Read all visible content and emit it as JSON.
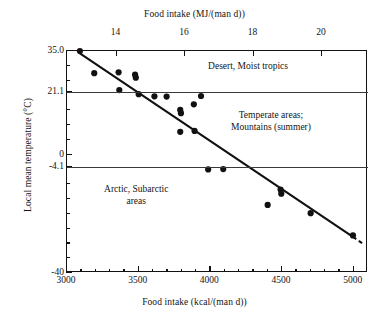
{
  "chart_data": {
    "type": "scatter",
    "title": "",
    "xlabel": "Food intake (kcal/(man d))",
    "xlabel_top": "Food intake (MJ/(man d))",
    "ylabel": "Local mean temperature (°C)",
    "xlim": [
      3000,
      5100
    ],
    "ylim": [
      -40,
      35
    ],
    "xlim_top": [
      12.552,
      21.34
    ],
    "grid": false,
    "legend": "none",
    "xticks": [
      3000,
      3500,
      4000,
      4500,
      5000
    ],
    "xticklabels": [
      "3000",
      "3500",
      "4000",
      "4500",
      "5000"
    ],
    "xticks_minor": [
      3100,
      3200,
      3300,
      3400,
      3600,
      3700,
      3800,
      3900,
      4100,
      4200,
      4300,
      4400,
      4600,
      4700,
      4800,
      4900
    ],
    "xticks_top": [
      14,
      16,
      18,
      20
    ],
    "xticklabels_top": [
      "14",
      "16",
      "18",
      "20"
    ],
    "yticks": [
      35.0,
      21.1,
      0,
      -4.1,
      -40
    ],
    "yticklabels": [
      "35.0",
      "21.1",
      "0",
      "-4.1",
      "-40"
    ],
    "yticks_minor": [
      30,
      25,
      15,
      10,
      5,
      -10,
      -15,
      -20,
      -25,
      -30,
      -35
    ],
    "points": [
      {
        "x": 3090,
        "y": 35.0
      },
      {
        "x": 3190,
        "y": 27.5
      },
      {
        "x": 3360,
        "y": 27.8
      },
      {
        "x": 3365,
        "y": 21.8
      },
      {
        "x": 3475,
        "y": 27.0
      },
      {
        "x": 3480,
        "y": 26.0
      },
      {
        "x": 3500,
        "y": 20.4
      },
      {
        "x": 3610,
        "y": 19.7
      },
      {
        "x": 3695,
        "y": 19.6
      },
      {
        "x": 3790,
        "y": 15.1
      },
      {
        "x": 3795,
        "y": 14.0
      },
      {
        "x": 3885,
        "y": 17.0
      },
      {
        "x": 3935,
        "y": 19.8
      },
      {
        "x": 3790,
        "y": 7.7
      },
      {
        "x": 3890,
        "y": 8.0
      },
      {
        "x": 3985,
        "y": -5.0
      },
      {
        "x": 4090,
        "y": -4.9
      },
      {
        "x": 4490,
        "y": -11.8
      },
      {
        "x": 4495,
        "y": -13.2
      },
      {
        "x": 4400,
        "y": -17.0
      },
      {
        "x": 4700,
        "y": -19.8
      },
      {
        "x": 4995,
        "y": -27.3
      }
    ],
    "fit_line": {
      "label": "regression line",
      "x_start": 3090,
      "y_start": 34.2,
      "x_end": 4995,
      "y_end": -27.8,
      "style": "solid",
      "extension": {
        "x_start": 4995,
        "y_start": -27.8,
        "x_end": 5075,
        "y_end": -30.4,
        "style": "dashed"
      }
    },
    "zone_lines": [
      {
        "y": 21.1,
        "label": "desert/temperate boundary"
      },
      {
        "y": -4.1,
        "label": "temperate/arctic boundary"
      }
    ],
    "annotations": [
      {
        "text": "Desert, Moist tropics",
        "x": 4270,
        "y": 29.5,
        "lines": [
          "Desert, Moist tropics"
        ]
      },
      {
        "text": "Temperate areas; Mountains (summer)",
        "x": 4430,
        "y": 11.0,
        "lines": [
          "Temperate areas;",
          "Mountains (summer)"
        ]
      },
      {
        "text": "Arctic, Subarctic areas",
        "x": 3490,
        "y": -14.0,
        "lines": [
          "Arctic, Subarctic",
          "areas"
        ]
      }
    ]
  },
  "axes": {
    "top_title": "Food intake (MJ/(man d))",
    "bottom_title": "Food intake (kcal/(man d))",
    "y_title": "Local mean temperature (°C)"
  },
  "colors": {
    "ink": "#111111",
    "marker": "#111111",
    "zone_line": "#3a3a3a",
    "background": "#ffffff"
  }
}
